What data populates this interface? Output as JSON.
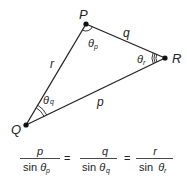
{
  "diagram": {
    "vertices": {
      "P": {
        "label": "P",
        "x": 86,
        "y": 24
      },
      "Q": {
        "label": "Q",
        "x": 26,
        "y": 125
      },
      "R": {
        "label": "R",
        "x": 165,
        "y": 58
      }
    },
    "sides": {
      "r": {
        "label": "r"
      },
      "q": {
        "label": "q"
      },
      "p": {
        "label": "p"
      }
    },
    "angles": {
      "theta_p": {
        "symbol": "θ",
        "sub": "p"
      },
      "theta_q": {
        "symbol": "θ",
        "sub": "q"
      },
      "theta_r": {
        "symbol": "θ",
        "sub": "r"
      }
    },
    "colors": {
      "stroke": "#222222",
      "background": "#ffffff"
    }
  },
  "formula": {
    "terms": [
      {
        "num": "p",
        "den_prefix": "sin ",
        "den_symbol": "θ",
        "den_sub": "p"
      },
      {
        "num": "q",
        "den_prefix": "sin ",
        "den_symbol": "θ",
        "den_sub": "q"
      },
      {
        "num": "r",
        "den_prefix": "sin ",
        "den_symbol": "θ",
        "den_sub": "r"
      }
    ],
    "equals": "="
  }
}
